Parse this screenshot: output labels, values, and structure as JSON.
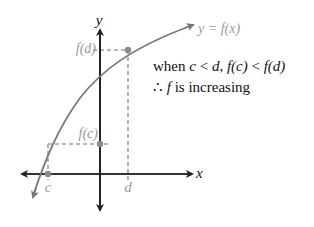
{
  "diagram": {
    "axes": {
      "x_label": "x",
      "y_label": "y"
    },
    "curve_label": "y = f(x)",
    "points": [
      {
        "name": "c",
        "x_label": "c",
        "y_label": "f(c)"
      },
      {
        "name": "d",
        "x_label": "d",
        "y_label": "f(d)"
      }
    ],
    "statement": {
      "line1_prefix": "when ",
      "line1_c": "c",
      "line1_lt1": " < ",
      "line1_d": "d",
      "line1_comma": ", ",
      "line1_fc": "f(c)",
      "line1_lt2": " < ",
      "line1_fd": "f(d)",
      "line2_therefore": "∴",
      "line2_f": "f",
      "line2_rest": " is increasing"
    },
    "colors": {
      "axis": "#333333",
      "curve": "#777777",
      "guide": "#9a9a9a",
      "label_gray": "#9a9a9a",
      "text": "#111111"
    }
  }
}
